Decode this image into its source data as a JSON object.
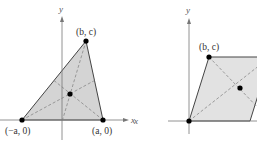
{
  "left_figure": {
    "axis_labels": {
      "x": "x",
      "y": "y"
    },
    "vertices": [
      {
        "label": "(−a, 0)",
        "x": 22,
        "y": 120
      },
      {
        "label": "(a, 0)",
        "x": 103,
        "y": 120
      },
      {
        "label": "(b, c)",
        "x": 86,
        "y": 41
      }
    ],
    "centroid": {
      "x": 70,
      "y": 94
    },
    "fill_color": "#d4d4d4"
  },
  "right_figure": {
    "axis_labels": {
      "x": "x",
      "y": "y"
    },
    "vertices": [
      {
        "label": "(b, c)",
        "x": 209,
        "y": 57
      }
    ],
    "origin": {
      "x": 189,
      "y": 121
    },
    "center_point": {
      "x": 240,
      "y": 88
    },
    "fill_color": "#e2e2e2"
  }
}
